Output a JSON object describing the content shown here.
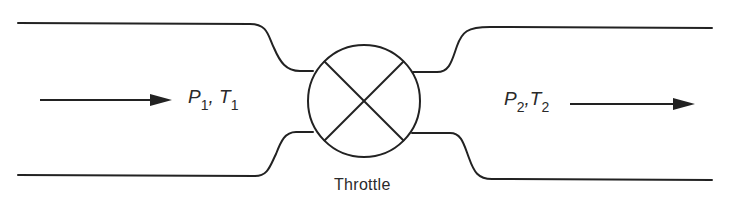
{
  "diagram": {
    "inlet": {
      "pressure_symbol": "P",
      "pressure_sub": "1",
      "sep": ", ",
      "temperature_symbol": "T",
      "temperature_sub": "1"
    },
    "outlet": {
      "pressure_symbol": "P",
      "pressure_sub": "2",
      "sep": ",",
      "temperature_symbol": "T",
      "temperature_sub": "2"
    },
    "device_label": "Throttle",
    "flow_direction": "left-to-right",
    "colors": {
      "stroke": "#222222",
      "background": "#ffffff"
    }
  }
}
